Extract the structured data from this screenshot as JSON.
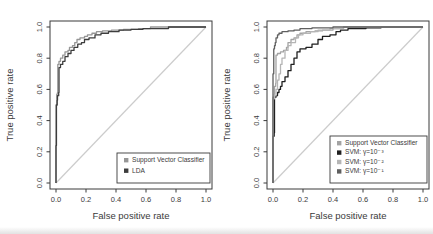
{
  "page": {
    "background": "#ffffff",
    "axis_color": "#3a3a3a",
    "text_color": "#3b3b3b",
    "diagonal_color": "#cccccc",
    "legend_bg": "#ffffff"
  },
  "chart_data": [
    {
      "type": "line",
      "subtype": "roc-step-curves",
      "title": "",
      "xlabel": "False positive rate",
      "ylabel": "True positive rate",
      "xlim": [
        0,
        1
      ],
      "ylim": [
        0,
        1
      ],
      "xtick_labels": [
        "0.0",
        "0.2",
        "0.4",
        "0.6",
        "0.8",
        "1.0"
      ],
      "ytick_labels": [
        "0.0",
        "0.2",
        "0.4",
        "0.6",
        "0.8",
        "1.0"
      ],
      "grid": false,
      "diagonal_reference_line": true,
      "legend": {
        "position": "bottom-right",
        "entries": [
          {
            "label": "Support Vector Classifier",
            "color": "#969696"
          },
          {
            "label": "LDA",
            "color": "#3d3d3d"
          }
        ]
      },
      "series": [
        {
          "name": "Support Vector Classifier",
          "color": "#969696",
          "points": [
            [
              0,
              0
            ],
            [
              0,
              0.5
            ],
            [
              0.005,
              0.57
            ],
            [
              0.01,
              0.58
            ],
            [
              0.012,
              0.76
            ],
            [
              0.02,
              0.78
            ],
            [
              0.03,
              0.8
            ],
            [
              0.045,
              0.82
            ],
            [
              0.06,
              0.84
            ],
            [
              0.08,
              0.85
            ],
            [
              0.09,
              0.87
            ],
            [
              0.11,
              0.88
            ],
            [
              0.125,
              0.9
            ],
            [
              0.14,
              0.92
            ],
            [
              0.16,
              0.93
            ],
            [
              0.19,
              0.94
            ],
            [
              0.21,
              0.95
            ],
            [
              0.24,
              0.96
            ],
            [
              0.27,
              0.97
            ],
            [
              0.31,
              0.975
            ],
            [
              0.37,
              0.98
            ],
            [
              0.45,
              0.985
            ],
            [
              0.55,
              0.99
            ],
            [
              0.63,
              1.0
            ],
            [
              1,
              1
            ]
          ]
        },
        {
          "name": "LDA",
          "color": "#3d3d3d",
          "points": [
            [
              0,
              0
            ],
            [
              0,
              0.24
            ],
            [
              0.003,
              0.5
            ],
            [
              0.008,
              0.53
            ],
            [
              0.01,
              0.56
            ],
            [
              0.018,
              0.58
            ],
            [
              0.02,
              0.74
            ],
            [
              0.03,
              0.76
            ],
            [
              0.045,
              0.78
            ],
            [
              0.06,
              0.81
            ],
            [
              0.08,
              0.83
            ],
            [
              0.1,
              0.85
            ],
            [
              0.12,
              0.87
            ],
            [
              0.145,
              0.89
            ],
            [
              0.17,
              0.9
            ],
            [
              0.19,
              0.92
            ],
            [
              0.22,
              0.93
            ],
            [
              0.26,
              0.95
            ],
            [
              0.3,
              0.96
            ],
            [
              0.35,
              0.97
            ],
            [
              0.42,
              0.98
            ],
            [
              0.5,
              0.985
            ],
            [
              0.58,
              0.99
            ],
            [
              0.75,
              1.0
            ],
            [
              1,
              1
            ]
          ]
        }
      ]
    },
    {
      "type": "line",
      "subtype": "roc-step-curves",
      "title": "",
      "xlabel": "False positive rate",
      "ylabel": "True positive rate",
      "xlim": [
        0,
        1
      ],
      "ylim": [
        0,
        1
      ],
      "xtick_labels": [
        "0.0",
        "0.2",
        "0.4",
        "0.6",
        "0.8",
        "1.0"
      ],
      "ytick_labels": [
        "0.0",
        "0.2",
        "0.4",
        "0.6",
        "0.8",
        "1.0"
      ],
      "grid": false,
      "diagonal_reference_line": true,
      "legend": {
        "position": "bottom-right",
        "entries": [
          {
            "label": "Support Vector Classifier",
            "color": "#a3a3a3"
          },
          {
            "label": "SVM: γ=10⁻³",
            "color": "#1f1f1f"
          },
          {
            "label": "SVM: γ=10⁻²",
            "color": "#b5b5b5"
          },
          {
            "label": "SVM: γ=10⁻¹",
            "color": "#5f5f5f"
          }
        ]
      },
      "series": [
        {
          "name": "Support Vector Classifier",
          "color": "#a3a3a3",
          "points": [
            [
              0,
              0
            ],
            [
              0,
              0.55
            ],
            [
              0.008,
              0.57
            ],
            [
              0.01,
              0.62
            ],
            [
              0.018,
              0.64
            ],
            [
              0.02,
              0.82
            ],
            [
              0.03,
              0.83
            ],
            [
              0.05,
              0.84
            ],
            [
              0.07,
              0.85
            ],
            [
              0.09,
              0.87
            ],
            [
              0.1,
              0.9
            ],
            [
              0.12,
              0.92
            ],
            [
              0.14,
              0.93
            ],
            [
              0.16,
              0.95
            ],
            [
              0.18,
              0.96
            ],
            [
              0.22,
              0.97
            ],
            [
              0.28,
              0.975
            ],
            [
              0.33,
              0.98
            ],
            [
              0.4,
              0.99
            ],
            [
              0.47,
              1.0
            ],
            [
              1,
              1
            ]
          ]
        },
        {
          "name": "SVM: γ=10⁻³",
          "color": "#1f1f1f",
          "points": [
            [
              0,
              0
            ],
            [
              0,
              0.3
            ],
            [
              0.008,
              0.32
            ],
            [
              0.01,
              0.55
            ],
            [
              0.02,
              0.56
            ],
            [
              0.03,
              0.58
            ],
            [
              0.04,
              0.6
            ],
            [
              0.05,
              0.62
            ],
            [
              0.06,
              0.65
            ],
            [
              0.08,
              0.68
            ],
            [
              0.1,
              0.72
            ],
            [
              0.12,
              0.76
            ],
            [
              0.14,
              0.8
            ],
            [
              0.16,
              0.84
            ],
            [
              0.18,
              0.86
            ],
            [
              0.22,
              0.87
            ],
            [
              0.26,
              0.89
            ],
            [
              0.3,
              0.92
            ],
            [
              0.33,
              0.94
            ],
            [
              0.38,
              0.95
            ],
            [
              0.42,
              0.97
            ],
            [
              0.45,
              0.98
            ],
            [
              0.5,
              0.99
            ],
            [
              0.62,
              0.995
            ],
            [
              0.72,
              1.0
            ],
            [
              1,
              1
            ]
          ]
        },
        {
          "name": "SVM: γ=10⁻²",
          "color": "#b5b5b5",
          "points": [
            [
              0,
              0
            ],
            [
              0,
              0.54
            ],
            [
              0.01,
              0.56
            ],
            [
              0.02,
              0.6
            ],
            [
              0.03,
              0.66
            ],
            [
              0.04,
              0.7
            ],
            [
              0.05,
              0.76
            ],
            [
              0.06,
              0.8
            ],
            [
              0.08,
              0.85
            ],
            [
              0.1,
              0.88
            ],
            [
              0.12,
              0.9
            ],
            [
              0.15,
              0.93
            ],
            [
              0.17,
              0.95
            ],
            [
              0.2,
              0.96
            ],
            [
              0.25,
              0.97
            ],
            [
              0.3,
              0.98
            ],
            [
              0.38,
              0.99
            ],
            [
              0.47,
              1.0
            ],
            [
              1,
              1
            ]
          ]
        },
        {
          "name": "SVM: γ=10⁻¹",
          "color": "#5f5f5f",
          "points": [
            [
              0,
              0
            ],
            [
              0,
              0.7
            ],
            [
              0.005,
              0.86
            ],
            [
              0.01,
              0.88
            ],
            [
              0.015,
              0.9
            ],
            [
              0.02,
              0.93
            ],
            [
              0.03,
              0.95
            ],
            [
              0.04,
              0.96
            ],
            [
              0.06,
              0.97
            ],
            [
              0.1,
              0.975
            ],
            [
              0.14,
              0.98
            ],
            [
              0.18,
              0.99
            ],
            [
              0.26,
              0.995
            ],
            [
              0.4,
              1.0
            ],
            [
              1,
              1
            ]
          ]
        }
      ]
    }
  ]
}
